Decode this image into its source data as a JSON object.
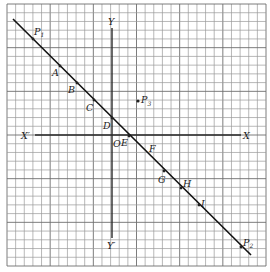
{
  "figure": {
    "type": "coordinate-grid-with-line",
    "grid": {
      "cells_x": 30,
      "cells_y": 30
    },
    "axes": {
      "x_positive_label": "X",
      "x_negative_label": "X′",
      "y_positive_label": "Y",
      "y_negative_label": "Y′",
      "origin_label": "O"
    },
    "line": {
      "start_label": "P",
      "start_subscript": "1",
      "end_label": "P",
      "end_subscript": "2"
    },
    "points_on_line": [
      "A",
      "B",
      "C",
      "D",
      "E",
      "F",
      "G",
      "H",
      "I"
    ],
    "off_line_point": {
      "label": "P",
      "subscript": "3"
    }
  }
}
